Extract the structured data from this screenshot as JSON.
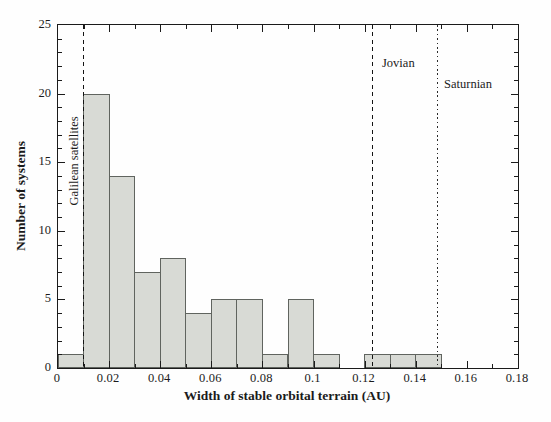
{
  "chart_data": {
    "type": "bar",
    "subtype": "histogram",
    "title": "",
    "xlabel": "Width of stable orbital terrain (AU)",
    "ylabel": "Number of systems",
    "xlim": [
      0,
      0.18
    ],
    "ylim": [
      0,
      25
    ],
    "grid": false,
    "bin_width": 0.01,
    "bin_edges": [
      0,
      0.01,
      0.02,
      0.03,
      0.04,
      0.05,
      0.06,
      0.07,
      0.08,
      0.09,
      0.1,
      0.11,
      0.12,
      0.13,
      0.14,
      0.15
    ],
    "counts": [
      1,
      20,
      14,
      7,
      8,
      4,
      5,
      5,
      1,
      5,
      1,
      0,
      1,
      1,
      1
    ],
    "x_tick_values": [
      0,
      0.02,
      0.04,
      0.06,
      0.08,
      0.1,
      0.12,
      0.14,
      0.16,
      0.18
    ],
    "x_tick_labels": [
      "0",
      "0.02",
      "0.04",
      "0.06",
      "0.08",
      "0.1",
      "0.12",
      "0.14",
      "0.16",
      "0.18"
    ],
    "x_minor_step": 0.01,
    "y_tick_values": [
      0,
      5,
      10,
      15,
      20,
      25
    ],
    "y_tick_labels": [
      "0",
      "5",
      "10",
      "15",
      "20",
      "25"
    ],
    "y_minor_step": 1,
    "reference_lines": [
      {
        "label": "Galilean satellites",
        "x": 0.01,
        "style": "dashed"
      },
      {
        "label": "Jovian",
        "x": 0.123,
        "style": "dashed"
      },
      {
        "label": "Saturnian",
        "x": 0.1485,
        "style": "dotted"
      }
    ],
    "colors": {
      "bar_fill": "#d8dad5",
      "bar_edge": "#60645f",
      "axis": "#1b1b1b",
      "background": "#fefefe"
    }
  }
}
